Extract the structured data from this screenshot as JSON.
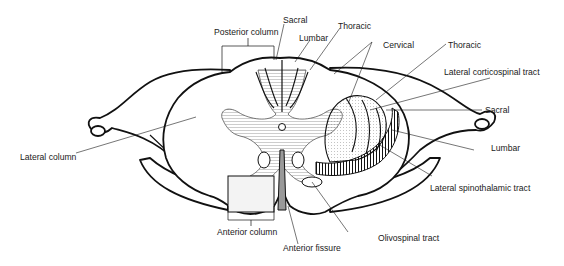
{
  "figure": {
    "labels": {
      "posterior_column": "Posterior column",
      "sacral_top": "Sacral",
      "lumbar_top": "Lumbar",
      "thoracic_top": "Thoracic",
      "cervical": "Cervical",
      "thoracic_right": "Thoracic",
      "lateral_corticospinal": "Lateral corticospinal tract",
      "sacral_right": "Sacral",
      "lumbar_right": "Lumbar",
      "lateral_spinothalamic": "Lateral spinothalamic tract",
      "lateral_column": "Lateral column",
      "anterior_column": "Anterior column",
      "anterior_fissure": "Anterior fissure",
      "olivospinal": "Olivospinal tract"
    },
    "colors": {
      "ink": "#111111",
      "grey_matter": "#c9c9c9",
      "shade": "#d9d9d9",
      "background": "#ffffff"
    }
  }
}
